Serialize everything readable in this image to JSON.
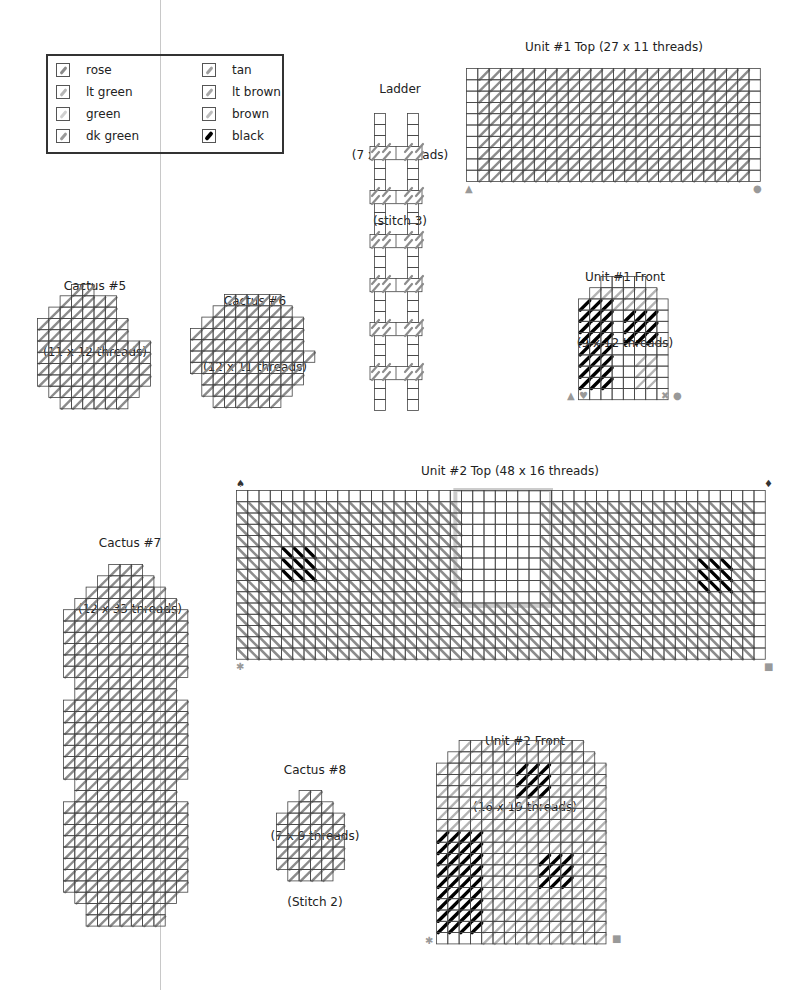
{
  "legend": {
    "items": [
      {
        "label": "rose",
        "color": "#8a8a8a"
      },
      {
        "label": "lt green",
        "color": "#b5b5b5"
      },
      {
        "label": "green",
        "color": "#cfcfcf"
      },
      {
        "label": "dk green",
        "color": "#9a9a9a"
      },
      {
        "label": "tan",
        "color": "#9f9f9f"
      },
      {
        "label": "lt brown",
        "color": "#a8a8a8"
      },
      {
        "label": "brown",
        "color": "#bdbdbd"
      },
      {
        "label": "black",
        "color": "#000000"
      }
    ]
  },
  "pieces": {
    "ladder": {
      "name": "Ladder",
      "size": "(7 x 28 threads)",
      "note": "(stitch 3)"
    },
    "unit1_top": {
      "name": "Unit #1 Top (27 x 11 threads)",
      "markers": [
        "▲",
        "●"
      ]
    },
    "unit1_front": {
      "name": "Unit #1 Front",
      "size": "(9 x 12 threads)",
      "markers": [
        "▲",
        "♥",
        "✖",
        "●"
      ]
    },
    "cactus5": {
      "name": "Cactus #5",
      "size": "(11 x 12 threads)"
    },
    "cactus6": {
      "name": "Cactus #6",
      "size": "(12 x 11 threads)"
    },
    "cactus7": {
      "name": "Cactus #7",
      "size": "(12 x 33 threads)"
    },
    "unit2_top": {
      "name": "Unit #2 Top (48 x 16 threads)",
      "markers": [
        "♠",
        "♦",
        "✱",
        "■"
      ]
    },
    "cactus8": {
      "name": "Cactus #8",
      "size": "(7 x 9 threads)",
      "note": "(Stitch 2)"
    },
    "unit2_front": {
      "name": "Unit #2 Front",
      "size": "(16 x 19 threads)",
      "markers": [
        "✱",
        "■"
      ]
    }
  },
  "colors": {
    "grid": "#444444",
    "stitch": "#8c8c8c",
    "stitch_light": "#b4b4b4",
    "black": "#000000",
    "frame": "#cccccc"
  }
}
